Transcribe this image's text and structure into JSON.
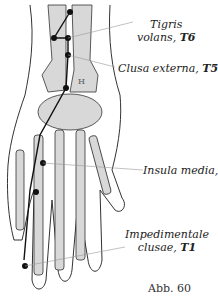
{
  "figure": {
    "caption": "Abb. 60",
    "colors": {
      "bone_fill": "#d8d8d8",
      "outline": "#222222",
      "meridian": "#111111",
      "leader": "#888888"
    }
  },
  "points": [
    {
      "name_line1": "Tigris",
      "name_line2": "volans,",
      "code": "T6"
    },
    {
      "name_line1": "Clusa externa,",
      "code": "T5"
    },
    {
      "name_line1": "Insula media,",
      "code": "T3"
    },
    {
      "name_line1": "Impedimentale",
      "name_line2": "clusae,",
      "code": "T1"
    }
  ],
  "bone_marker": "H"
}
